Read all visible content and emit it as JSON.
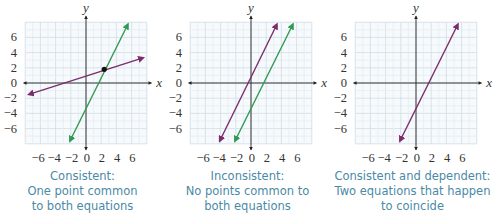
{
  "chart_data": [
    {
      "type": "line",
      "title": "Consistent",
      "xlabel": "x",
      "ylabel": "y",
      "xlim": [
        -8,
        8
      ],
      "ylim": [
        -8,
        8
      ],
      "grid": true,
      "x_ticks": [
        "−6",
        "−4",
        "−2",
        "0",
        "2",
        "4",
        "6"
      ],
      "y_ticks": [
        "6",
        "4",
        "2",
        "0",
        "−2",
        "−4",
        "−6"
      ],
      "series": [
        {
          "name": "line 1",
          "color": "#7b2d6b",
          "x": [
            -7.5,
            7.5
          ],
          "y": [
            -1.5,
            3.3
          ]
        },
        {
          "name": "line 2",
          "color": "#2f9a52",
          "x": [
            -2.1,
            5.5
          ],
          "y": [
            -7.6,
            7.7
          ]
        }
      ],
      "annotations": [
        {
          "type": "point",
          "x": 2.4,
          "y": 1.8,
          "label": "intersection"
        }
      ],
      "caption": [
        "Consistent:",
        "One point common",
        "to both equations"
      ]
    },
    {
      "type": "line",
      "title": "Inconsistent",
      "xlabel": "x",
      "ylabel": "y",
      "xlim": [
        -8,
        8
      ],
      "ylim": [
        -8,
        8
      ],
      "grid": true,
      "x_ticks": [
        "−6",
        "−4",
        "−2",
        "0",
        "2",
        "4",
        "6"
      ],
      "y_ticks": [
        "6",
        "4",
        "2",
        "0",
        "−2",
        "−4",
        "−6"
      ],
      "series": [
        {
          "name": "line 1",
          "color": "#7b2d6b",
          "x": [
            -4.1,
            3.4
          ],
          "y": [
            -7.6,
            7.7
          ]
        },
        {
          "name": "line 2",
          "color": "#2f9a52",
          "x": [
            -2.1,
            5.5
          ],
          "y": [
            -7.6,
            7.7
          ]
        }
      ],
      "caption": [
        "Inconsistent:",
        "No points common to",
        "both equations"
      ]
    },
    {
      "type": "line",
      "title": "Consistent and dependent",
      "xlabel": "x",
      "ylabel": "y",
      "xlim": [
        -8,
        8
      ],
      "ylim": [
        -8,
        8
      ],
      "grid": true,
      "x_ticks": [
        "−6",
        "−4",
        "−2",
        "0",
        "2",
        "4",
        "6"
      ],
      "y_ticks": [
        "6",
        "4",
        "2",
        "0",
        "−2",
        "−4",
        "−6"
      ],
      "series": [
        {
          "name": "coinciding lines",
          "color": "#7b2d6b",
          "x": [
            -2.1,
            5.5
          ],
          "y": [
            -7.6,
            7.7
          ]
        }
      ],
      "caption": [
        "Consistent and dependent:",
        "Two equations that happen",
        "to coincide"
      ]
    }
  ],
  "panels": [
    {
      "caption": [
        "Consistent:",
        "One point common",
        "to both equations"
      ]
    },
    {
      "caption": [
        "Inconsistent:",
        "No points common to",
        "both equations"
      ]
    },
    {
      "caption": [
        "Consistent and dependent:",
        "Two equations that happen",
        "to coincide"
      ]
    }
  ],
  "axes": {
    "x_label": "x",
    "y_label": "y"
  },
  "colors": {
    "purple": "#7b2d6b",
    "green": "#2f9a52",
    "grid": "#d8e4ec",
    "caption": "#4a8aa6"
  }
}
